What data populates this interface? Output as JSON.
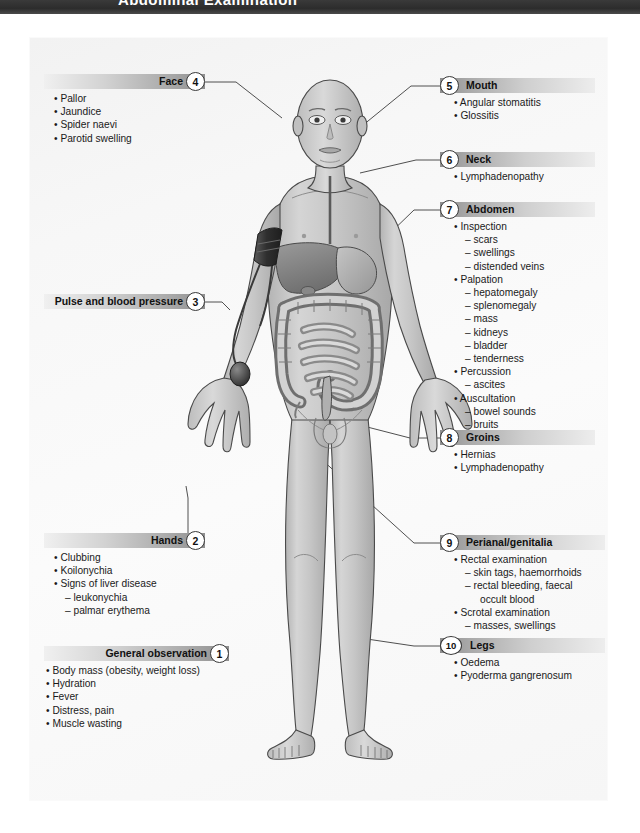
{
  "header": {
    "title": "Abdominal Examination"
  },
  "figure": {
    "alt": "Anatomical illustration of a standing male figure showing abdominal organs and a blood pressure cuff on the left arm"
  },
  "callouts": [
    {
      "number": "1",
      "title": "General observation",
      "align": "left",
      "items": [
        {
          "level": 1,
          "text": "Body mass (obesity, weight loss)"
        },
        {
          "level": 1,
          "text": "Hydration"
        },
        {
          "level": 1,
          "text": "Fever"
        },
        {
          "level": 1,
          "text": "Distress, pain"
        },
        {
          "level": 1,
          "text": "Muscle wasting"
        }
      ]
    },
    {
      "number": "2",
      "title": "Hands",
      "align": "left",
      "items": [
        {
          "level": 1,
          "text": "Clubbing"
        },
        {
          "level": 1,
          "text": "Koilonychia"
        },
        {
          "level": 1,
          "text": "Signs of liver disease"
        },
        {
          "level": 2,
          "text": "leukonychia"
        },
        {
          "level": 2,
          "text": "palmar erythema"
        }
      ]
    },
    {
      "number": "3",
      "title": "Pulse and blood pressure",
      "align": "left",
      "items": []
    },
    {
      "number": "4",
      "title": "Face",
      "align": "left",
      "items": [
        {
          "level": 1,
          "text": "Pallor"
        },
        {
          "level": 1,
          "text": "Jaundice"
        },
        {
          "level": 1,
          "text": "Spider naevi"
        },
        {
          "level": 1,
          "text": "Parotid swelling"
        }
      ]
    },
    {
      "number": "5",
      "title": "Mouth",
      "align": "right",
      "items": [
        {
          "level": 1,
          "text": "Angular stomatitis"
        },
        {
          "level": 1,
          "text": "Glossitis"
        }
      ]
    },
    {
      "number": "6",
      "title": "Neck",
      "align": "right",
      "items": [
        {
          "level": 1,
          "text": "Lymphadenopathy"
        }
      ]
    },
    {
      "number": "7",
      "title": "Abdomen",
      "align": "right",
      "items": [
        {
          "level": 1,
          "text": "Inspection"
        },
        {
          "level": 2,
          "text": "scars"
        },
        {
          "level": 2,
          "text": "swellings"
        },
        {
          "level": 2,
          "text": "distended veins"
        },
        {
          "level": 1,
          "text": "Palpation"
        },
        {
          "level": 2,
          "text": "hepatomegaly"
        },
        {
          "level": 2,
          "text": "splenomegaly"
        },
        {
          "level": 2,
          "text": "mass"
        },
        {
          "level": 2,
          "text": "kidneys"
        },
        {
          "level": 2,
          "text": "bladder"
        },
        {
          "level": 2,
          "text": "tenderness"
        },
        {
          "level": 1,
          "text": "Percussion"
        },
        {
          "level": 2,
          "text": "ascites"
        },
        {
          "level": 1,
          "text": "Auscultation"
        },
        {
          "level": 2,
          "text": "bowel sounds"
        },
        {
          "level": 2,
          "text": "bruits"
        }
      ]
    },
    {
      "number": "8",
      "title": "Groins",
      "align": "right",
      "items": [
        {
          "level": 1,
          "text": "Hernias"
        },
        {
          "level": 1,
          "text": "Lymphadenopathy"
        }
      ]
    },
    {
      "number": "9",
      "title": "Perianal/genitalia",
      "align": "right",
      "items": [
        {
          "level": 1,
          "text": "Rectal examination"
        },
        {
          "level": 2,
          "text": "skin tags, haemorrhoids"
        },
        {
          "level": 2,
          "text": "rectal bleeding, faecal"
        },
        {
          "level": 3,
          "text": "occult blood"
        },
        {
          "level": 1,
          "text": "Scrotal examination"
        },
        {
          "level": 2,
          "text": "masses, swellings"
        }
      ]
    },
    {
      "number": "10",
      "title": "Legs",
      "align": "right",
      "items": [
        {
          "level": 1,
          "text": "Oedema"
        },
        {
          "level": 1,
          "text": "Pyoderma gangrenosum"
        }
      ]
    }
  ],
  "colors": {
    "header_bar": "#2c2c2c",
    "panel_bg": "#f7f7f7",
    "bar_dark": "#8f8f8f",
    "bar_light": "#ededed",
    "text": "#1a1a1a",
    "leader_line": "#3c3c3c",
    "skin": "#c9c9c9",
    "cuff": "#3a3a3a"
  }
}
